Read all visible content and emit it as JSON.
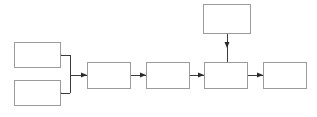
{
  "diagram": {
    "title": "",
    "canvas": {
      "width": 317,
      "height": 117,
      "background": "#ffffff"
    },
    "style": {
      "box_stroke": "#9b9b9b",
      "box_fill": "#ffffff",
      "connector_stroke": "#3a3a3a",
      "arrow_fill": "#2a2a2a"
    },
    "nodes": [
      {
        "id": "node-top-left",
        "label": "",
        "x": 14,
        "y": 42,
        "width": 46,
        "height": 25
      },
      {
        "id": "node-bottom-left",
        "label": "",
        "x": 14,
        "y": 80,
        "width": 46,
        "height": 25
      },
      {
        "id": "node-chain-1",
        "label": "",
        "x": 87,
        "y": 62,
        "width": 43,
        "height": 26
      },
      {
        "id": "node-chain-2",
        "label": "",
        "x": 146,
        "y": 62,
        "width": 43,
        "height": 26
      },
      {
        "id": "node-chain-3",
        "label": "",
        "x": 204,
        "y": 62,
        "width": 43,
        "height": 26
      },
      {
        "id": "node-chain-4",
        "label": "",
        "x": 263,
        "y": 62,
        "width": 44,
        "height": 26
      },
      {
        "id": "node-top-feeder",
        "label": "",
        "x": 203,
        "y": 4,
        "width": 47,
        "height": 29
      }
    ],
    "connectors": [
      {
        "id": "link-top-left-to-bus",
        "from": "node-top-left",
        "to": "bus",
        "direction": "right"
      },
      {
        "id": "link-bottom-left-to-bus",
        "from": "node-bottom-left",
        "to": "bus",
        "direction": "right"
      },
      {
        "id": "link-bus-to-chain-1",
        "from": "bus",
        "to": "node-chain-1",
        "direction": "right"
      },
      {
        "id": "link-chain-1-to-chain-2",
        "from": "node-chain-1",
        "to": "node-chain-2",
        "direction": "right"
      },
      {
        "id": "link-chain-2-to-chain-3",
        "from": "node-chain-2",
        "to": "node-chain-3",
        "direction": "right"
      },
      {
        "id": "link-chain-3-to-chain-4",
        "from": "node-chain-3",
        "to": "node-chain-4",
        "direction": "right"
      },
      {
        "id": "link-top-feeder-down",
        "from": "node-top-feeder",
        "to": "node-chain-3",
        "direction": "down"
      }
    ],
    "bus": {
      "x": 70,
      "y_top": 54,
      "y_bottom": 93,
      "y_out": 75
    }
  }
}
